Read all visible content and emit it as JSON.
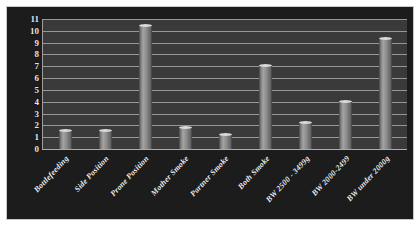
{
  "chart_data": {
    "type": "bar",
    "title": "",
    "xlabel": "",
    "ylabel": "",
    "ylim": [
      0,
      11
    ],
    "grid": true,
    "legend": "none",
    "yticks": [
      11,
      10,
      9,
      8,
      7,
      6,
      5,
      4,
      3,
      2,
      1,
      0
    ],
    "categories": [
      "Bottlefeeding",
      "Side Position",
      "Prone Position",
      "Mother Smoke",
      "Partner Smoke",
      "Both Smoke",
      "BW 2500 - 3499g",
      "BW 2000-2499",
      "BW under 2000g"
    ],
    "values": [
      1.5,
      1.5,
      10.4,
      1.8,
      1.2,
      7.0,
      2.2,
      4.0,
      9.3
    ]
  },
  "style": {
    "panel_background": "#1c1c1c",
    "plot_background": "#3a3a3a",
    "gridline_color": "#a8a8a8",
    "bar_color": "#9a9a9a",
    "tick_text_color": "#e8e8e8",
    "label_text_color": "#efefef",
    "page_background": "#ffffff"
  }
}
